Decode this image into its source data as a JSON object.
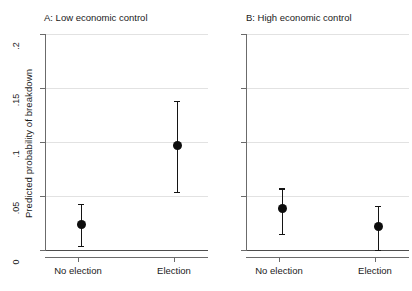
{
  "chart_data": {
    "type": "scatter",
    "title": "",
    "xlabel": "",
    "ylabel": "Predicted probability of breakdown",
    "ylim": [
      0,
      0.2
    ],
    "yticks": [
      0,
      0.05,
      0.1,
      0.15,
      0.2
    ],
    "ytick_labels": [
      "0",
      ".05",
      ".1",
      ".15",
      ".2"
    ],
    "grid": true,
    "legend": "none",
    "categories": [
      "No election",
      "Election"
    ],
    "panels": [
      {
        "key": "a",
        "title": "A: Low economic control",
        "points": [
          {
            "category": "No election",
            "value": 0.024,
            "low": 0.004,
            "high": 0.043
          },
          {
            "category": "Election",
            "value": 0.097,
            "low": 0.054,
            "high": 0.138
          }
        ]
      },
      {
        "key": "b",
        "title": "B: High economic control",
        "points": [
          {
            "category": "No election",
            "value": 0.038,
            "low": 0.015,
            "high": 0.057
          },
          {
            "category": "Election",
            "value": 0.022,
            "low": 0.0,
            "high": 0.041
          }
        ]
      }
    ]
  },
  "panel_a": {
    "title": "A: Low economic control",
    "x_labels": {
      "left": "No election",
      "right": "Election"
    }
  },
  "panel_b": {
    "title": "B: High economic control",
    "x_labels": {
      "left": "No election",
      "right": "Election"
    }
  },
  "axis": {
    "y_title": "Predicted probability of breakdown",
    "y_labels": {
      "t0": "0",
      "t1": ".05",
      "t2": ".1",
      "t3": ".15",
      "t4": ".2"
    }
  },
  "colors": {
    "marker": "#0d0d0d",
    "gridline": "#e2e2e2",
    "axis": "#6b6b6b",
    "zeroline": "#4d4d4d",
    "background": "#ffffff"
  }
}
